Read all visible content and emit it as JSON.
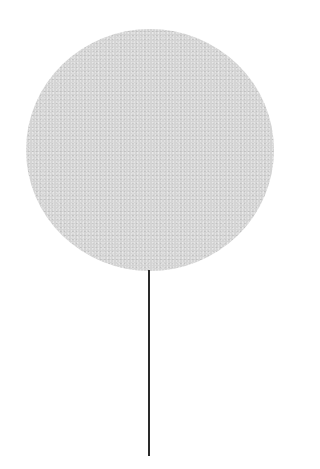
{
  "image": {
    "subject": "lollipop-shaped object",
    "disc_color": "#d4d4d4",
    "stick_color": "#2a2a2a",
    "background": "#ffffff"
  }
}
